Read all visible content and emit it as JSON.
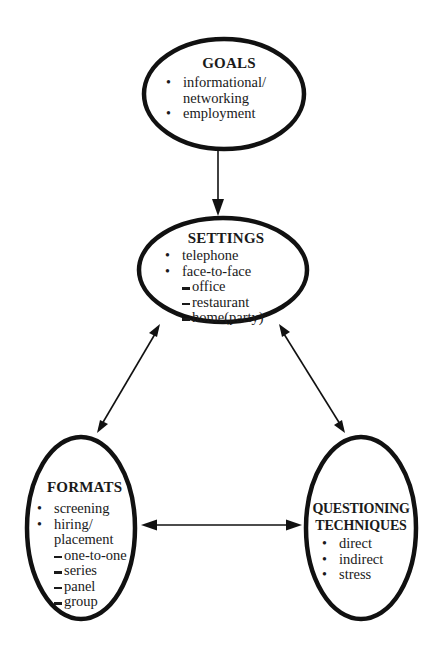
{
  "diagram": {
    "nodes": {
      "goals": {
        "title": "GOALS",
        "items": [
          {
            "type": "bullet",
            "text": "informational/"
          },
          {
            "type": "cont",
            "text": "networking"
          },
          {
            "type": "bullet",
            "text": "employment"
          }
        ]
      },
      "settings": {
        "title": "SETTINGS",
        "items": [
          {
            "type": "bullet",
            "text": "telephone"
          },
          {
            "type": "bullet",
            "text": "face-to-face"
          },
          {
            "type": "dash",
            "text": "office"
          },
          {
            "type": "dash",
            "text": "restaurant"
          },
          {
            "type": "dash",
            "text": "home(party)"
          }
        ]
      },
      "formats": {
        "title": "FORMATS",
        "items": [
          {
            "type": "bullet",
            "text": "screening"
          },
          {
            "type": "bullet",
            "text": "hiring/"
          },
          {
            "type": "cont",
            "text": "placement"
          },
          {
            "type": "dash",
            "text": "one-to-one"
          },
          {
            "type": "dash",
            "text": "series"
          },
          {
            "type": "dash",
            "text": "panel"
          },
          {
            "type": "dash",
            "text": "group"
          }
        ]
      },
      "questioning": {
        "title_line1": "QUESTIONING",
        "title_line2": "TECHNIQUES",
        "items": [
          {
            "type": "bullet",
            "text": "direct"
          },
          {
            "type": "bullet",
            "text": "indirect"
          },
          {
            "type": "bullet",
            "text": "stress"
          }
        ]
      }
    },
    "edges": [
      {
        "from": "goals",
        "to": "settings",
        "direction": "one-way"
      },
      {
        "from": "settings",
        "to": "formats",
        "direction": "two-way"
      },
      {
        "from": "settings",
        "to": "questioning",
        "direction": "two-way"
      },
      {
        "from": "formats",
        "to": "questioning",
        "direction": "two-way"
      }
    ],
    "colors": {
      "stroke": "#111111",
      "text": "#1a1a1a",
      "background": "#ffffff"
    }
  }
}
